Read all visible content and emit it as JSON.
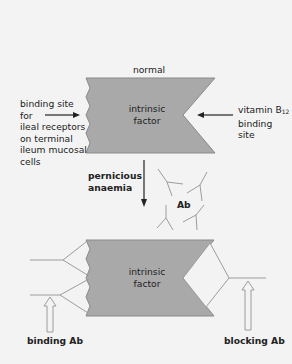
{
  "colors": {
    "background": "#f3f3f3",
    "box_fill": "#a9a9a9",
    "box_stroke": "#8a8a8a",
    "antibody_line": "#9c9c9c",
    "arrow": "#222222"
  },
  "top_panel": {
    "title": "normal",
    "box_label_line1": "intrinsic",
    "box_label_line2": "factor",
    "left_label": [
      "binding site",
      "for",
      "ileal receptors",
      "on terminal",
      "ileum mucosal",
      "cells"
    ],
    "right_label_prefix": "vitamin B",
    "right_label_sub": "12",
    "right_label_rest": [
      "binding",
      "site"
    ]
  },
  "transition": {
    "label_line1": "pernicious",
    "label_line2": "anaemia",
    "antibody_label": "Ab"
  },
  "bottom_panel": {
    "box_label_line1": "intrinsic",
    "box_label_line2": "factor",
    "left_label": "binding Ab",
    "right_label": "blocking Ab"
  }
}
